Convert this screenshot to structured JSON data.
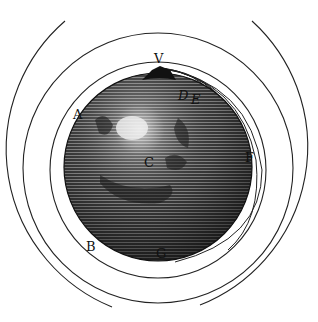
{
  "figure": {
    "colors": {
      "ink": "#111111",
      "paper": "#ffffff",
      "globe_dark": "#2a2a2a",
      "globe_mid": "#6a6a6a",
      "highlight": "#e8e8e8"
    },
    "labels": {
      "V": "V",
      "D": "D",
      "E": "E",
      "F": "F",
      "A": "A",
      "B": "B",
      "C": "C",
      "G": "G"
    }
  }
}
